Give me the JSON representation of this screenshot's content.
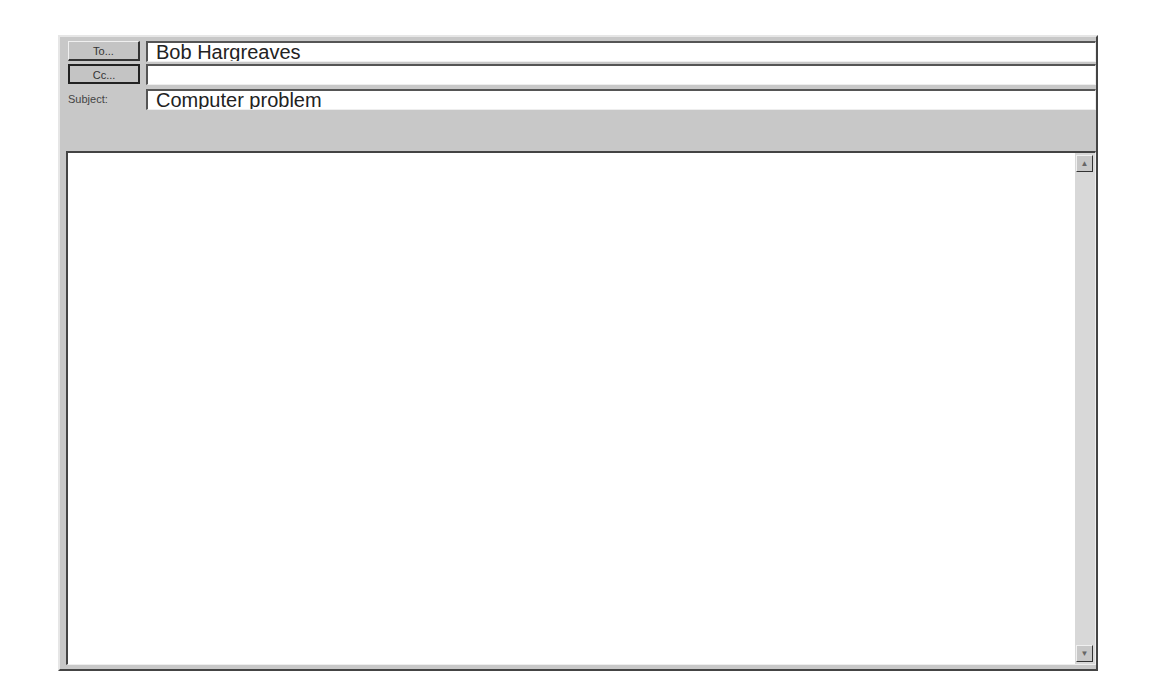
{
  "header": {
    "to_button_label": "To...",
    "cc_button_label": "Cc...",
    "subject_label": "Subject:",
    "to_value": "Bob Hargreaves",
    "cc_value": "",
    "subject_value": "Computer problem"
  },
  "body": {
    "text": ""
  },
  "scrollbar": {
    "up_icon": "▲",
    "down_icon": "▼"
  }
}
